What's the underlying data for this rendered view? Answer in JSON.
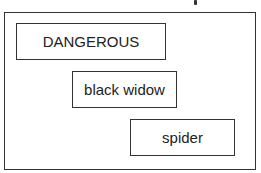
{
  "diagram": {
    "boxes": [
      {
        "label": "DANGEROUS"
      },
      {
        "label": "black widow"
      },
      {
        "label": "spider"
      }
    ]
  }
}
